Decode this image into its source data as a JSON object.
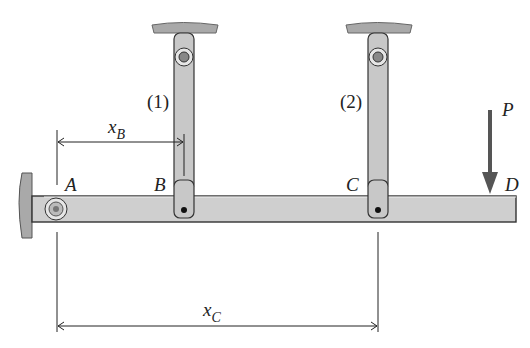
{
  "diagram": {
    "type": "rigid bar supported by two hanger links with fixed pin at A and load at D",
    "points": {
      "A": "A",
      "B": "B",
      "C": "C",
      "D": "D"
    },
    "members": {
      "link1": "(1)",
      "link2": "(2)"
    },
    "load": {
      "label": "P",
      "direction": "downward"
    },
    "dimensions": {
      "xB": {
        "main": "x",
        "sub": "B"
      },
      "xC": {
        "main": "x",
        "sub": "C"
      }
    },
    "colors": {
      "member_fill": "#c8c8c8",
      "member_stroke": "#333333",
      "support_fill": "#a9a9a9",
      "arrow": "#555555",
      "line": "#222222"
    }
  }
}
